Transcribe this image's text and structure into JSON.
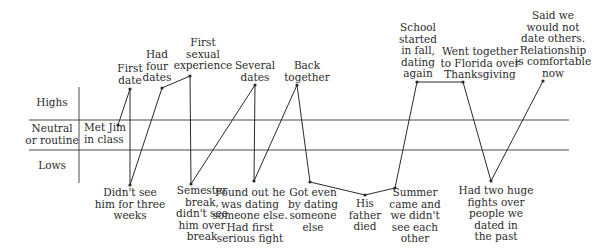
{
  "chart_data": {
    "type": "line",
    "title": "",
    "xlabel": "",
    "ylabel": "",
    "bands": [
      {
        "id": "highs",
        "label": "Highs"
      },
      {
        "id": "neutral",
        "label": "Neutral\nor routine"
      },
      {
        "id": "lows",
        "label": "Lows"
      }
    ],
    "grid": false,
    "legend": "none",
    "points": [
      {
        "label": "Met Jim\nin class",
        "level": "neutral",
        "x": 118,
        "y": 125
      },
      {
        "label": "First\ndate",
        "level": "high",
        "x": 130,
        "y": 89
      },
      {
        "label": "Didn't see\nhim for three\nweeks",
        "level": "low",
        "x": 130,
        "y": 185
      },
      {
        "label": "Had\nfour\ndates",
        "level": "high",
        "x": 162,
        "y": 88
      },
      {
        "label": "First\nsexual\nexperience",
        "level": "high",
        "x": 190,
        "y": 76
      },
      {
        "label": "Semester\nbreak,\ndidn't see\nhim over\nbreak",
        "level": "low",
        "x": 191,
        "y": 184
      },
      {
        "label": "Several\ndates",
        "level": "high",
        "x": 255,
        "y": 85
      },
      {
        "label": "Found out he\nwas dating\nsomeone else.\nHad first\nserious fight",
        "level": "low",
        "x": 254,
        "y": 181
      },
      {
        "label": "Back\ntogether",
        "level": "high",
        "x": 297,
        "y": 85
      },
      {
        "label": "Got even\nby dating\nsomeone\nelse",
        "level": "low",
        "x": 310,
        "y": 182
      },
      {
        "label": "His\nfather\ndied",
        "level": "low",
        "x": 365,
        "y": 195
      },
      {
        "label": "Summer\ncame and\nwe didn't\nsee each\nother",
        "level": "low",
        "x": 395,
        "y": 188
      },
      {
        "label": "School\nstarted\nin fall,\ndating\nagain",
        "level": "high",
        "x": 417,
        "y": 82
      },
      {
        "label": "Went together\nto Florida over\nThanksgiving",
        "level": "high",
        "x": 463,
        "y": 82
      },
      {
        "label": "Had two huge\nfights over\npeople we\ndated in\nthe past",
        "level": "low",
        "x": 491,
        "y": 181
      },
      {
        "label": "Said we\nwould not\ndate others.\nRelationship\nis comfortable\nnow",
        "level": "high",
        "x": 543,
        "y": 81
      }
    ]
  },
  "axis": {
    "band_labels": {
      "highs": "Highs",
      "neutral_line1": "Neutral",
      "neutral_line2": "or routine",
      "lows": "Lows"
    }
  },
  "annotations": [
    {
      "id": "met-jim",
      "text": "Met Jim\nin class",
      "left": 84,
      "top": 122,
      "align": "left"
    },
    {
      "id": "first-date",
      "text": "First\ndate",
      "cx": 130,
      "top": 63
    },
    {
      "id": "didnt-see",
      "text": "Didn't see\nhim for three\nweeks",
      "cx": 130,
      "top": 187
    },
    {
      "id": "four-dates",
      "text": "Had\nfour\ndates",
      "cx": 157,
      "top": 49
    },
    {
      "id": "first-sexual",
      "text": "First\nsexual\nexperience",
      "cx": 203,
      "top": 37
    },
    {
      "id": "semester-break",
      "text": "Semester\nbreak,\ndidn't see\nhim over\nbreak",
      "cx": 202,
      "top": 185
    },
    {
      "id": "several-dates",
      "text": "Several\ndates",
      "cx": 255,
      "top": 60
    },
    {
      "id": "found-out",
      "text": "Found out he\nwas dating\nsomeone else.\nHad first\nserious fight",
      "cx": 250,
      "top": 187
    },
    {
      "id": "back-together",
      "text": "Back\ntogether",
      "cx": 307,
      "top": 60
    },
    {
      "id": "got-even",
      "text": "Got even\nby dating\nsomeone\nelse",
      "cx": 313,
      "top": 187
    },
    {
      "id": "father-died",
      "text": "His\nfather\ndied",
      "cx": 365,
      "top": 198
    },
    {
      "id": "summer",
      "text": "Summer\ncame and\nwe didn't\nsee each\nother",
      "cx": 415,
      "top": 187
    },
    {
      "id": "school-started",
      "text": "School\nstarted\nin fall,\ndating\nagain",
      "cx": 418,
      "top": 22
    },
    {
      "id": "florida",
      "text": "Went together\nto Florida over\nThanksgiving",
      "cx": 480,
      "top": 46
    },
    {
      "id": "two-fights",
      "text": "Had two huge\nfights over\npeople we\ndated in\nthe past",
      "cx": 496,
      "top": 185
    },
    {
      "id": "said-we",
      "text": "Said we\nwould not\ndate others.\nRelationship\nis comfortable\nnow",
      "cx": 553,
      "top": 10
    }
  ],
  "colors": {
    "line": "#2a2a2a",
    "text": "#2b2b2b",
    "background": "#ffffff"
  }
}
